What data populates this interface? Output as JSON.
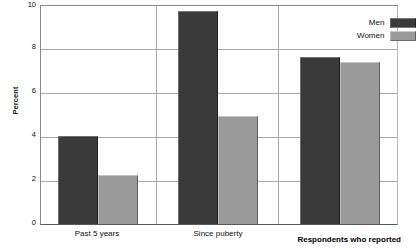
{
  "chart_data": {
    "type": "bar",
    "title": "",
    "subtitle": "",
    "xlabel": "Respondents who reported",
    "ylabel": "Percent",
    "categories": [
      "Past 5 years",
      "Since puberty",
      ""
    ],
    "series": [
      {
        "name": "Men",
        "color": "#3a3a3a",
        "values": [
          4.05,
          9.75,
          7.65
        ]
      },
      {
        "name": "Women",
        "color": "#9a9a9a",
        "values": [
          2.25,
          4.95,
          7.45
        ]
      }
    ],
    "ylim": [
      0,
      10
    ],
    "yticks": [
      0,
      2,
      4,
      6,
      8,
      10
    ],
    "ytick_labels": [
      "0",
      "2",
      "4",
      "6",
      "8",
      "10"
    ],
    "grid": "horizontal-and-group-separators",
    "legend_position": "top-right"
  },
  "axes": {
    "y_title": "Percent",
    "x_title": "Respondents who reported",
    "y_labels": {
      "t0": "0",
      "t2": "2",
      "t4": "4",
      "t6": "6",
      "t8": "8",
      "t10": "10"
    },
    "x_labels": {
      "g0": "Past 5 years",
      "g1": "Since puberty",
      "g2": ""
    }
  },
  "legend": {
    "items": [
      {
        "label": "Men",
        "color": "#3a3a3a"
      },
      {
        "label": "Women",
        "color": "#9a9a9a"
      }
    ]
  }
}
